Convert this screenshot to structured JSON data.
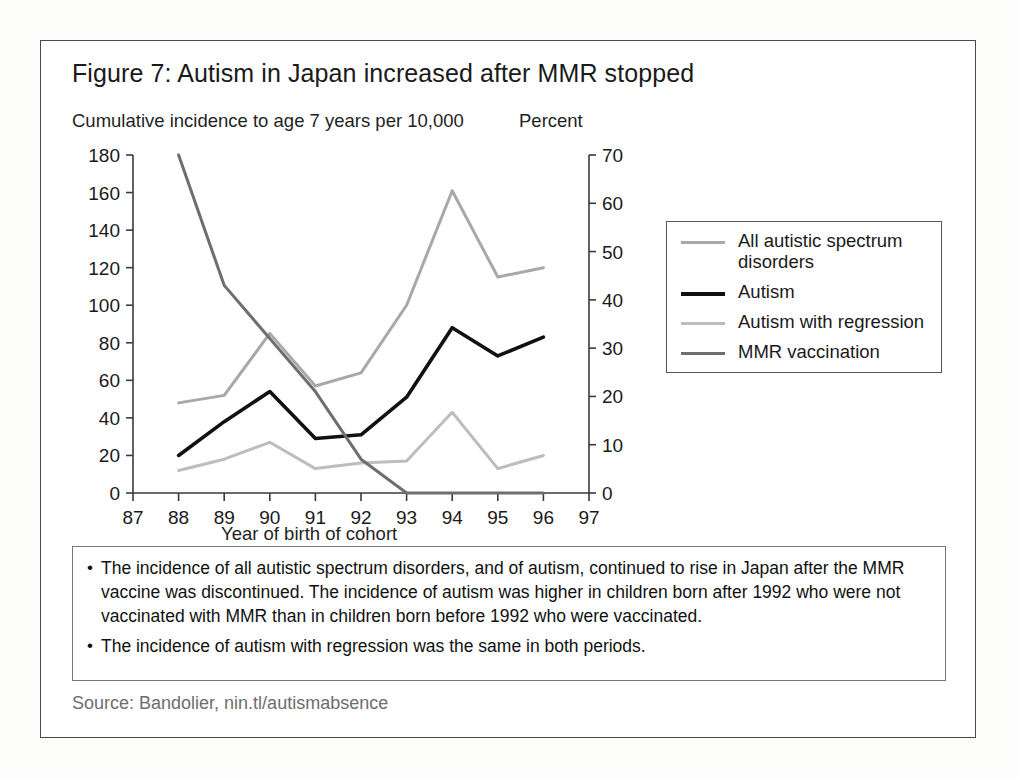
{
  "figure": {
    "title": "Figure 7: Autism in Japan increased after MMR stopped",
    "source": "Source: Bandolier, nin.tl/autismabsence"
  },
  "axis_titles": {
    "left": "Cumulative incidence to age 7 years per 10,000",
    "right": "Percent",
    "x": "Year of birth of cohort"
  },
  "legend": {
    "items": [
      {
        "label": "All autistic spectrum disorders",
        "color": "#a8a8a8"
      },
      {
        "label": "Autism",
        "color": "#111111"
      },
      {
        "label": "Autism with regression",
        "color": "#bdbdbd"
      },
      {
        "label": "MMR vaccination",
        "color": "#6e6e6e"
      }
    ]
  },
  "notes": [
    "The incidence of all autistic spectrum disorders, and of autism, continued to rise in Japan after the MMR vaccine was discontinued. The incidence of autism was higher in children born after 1992 who were not vaccinated with MMR than in children born before 1992 who were vaccinated.",
    "The incidence of autism with regression was the same in both periods."
  ],
  "chart_data": {
    "type": "line",
    "title": "Figure 7: Autism in Japan increased after MMR stopped",
    "xlabel": "Year of birth of cohort",
    "ylabel": "Cumulative incidence to age 7 years per 10,000",
    "y2label": "Percent",
    "xlim": [
      87,
      97
    ],
    "ylim": [
      0,
      180
    ],
    "y2lim": [
      0,
      70
    ],
    "grid": false,
    "legend_position": "right",
    "xticks": [
      87,
      88,
      89,
      90,
      91,
      92,
      93,
      94,
      95,
      96,
      97
    ],
    "yticks": [
      0,
      20,
      40,
      60,
      80,
      100,
      120,
      140,
      160,
      180
    ],
    "y2ticks": [
      0,
      10,
      20,
      30,
      40,
      50,
      60,
      70
    ],
    "x": [
      88,
      89,
      90,
      91,
      92,
      93,
      94,
      95,
      96
    ],
    "series": [
      {
        "name": "All autistic spectrum disorders",
        "axis": "left",
        "color": "#a8a8a8",
        "width": 3.0,
        "values": [
          48,
          52,
          85,
          57,
          64,
          100,
          161,
          115,
          120
        ]
      },
      {
        "name": "Autism",
        "axis": "left",
        "color": "#111111",
        "width": 3.6,
        "values": [
          20,
          38,
          54,
          29,
          31,
          51,
          88,
          73,
          83
        ]
      },
      {
        "name": "Autism with regression",
        "axis": "left",
        "color": "#bdbdbd",
        "width": 3.0,
        "values": [
          12,
          18,
          27,
          13,
          16,
          17,
          43,
          13,
          20
        ]
      },
      {
        "name": "MMR vaccination",
        "axis": "right",
        "color": "#6e6e6e",
        "width": 3.0,
        "values": [
          70,
          43,
          32,
          21,
          7,
          0,
          0,
          0,
          0
        ]
      }
    ]
  }
}
